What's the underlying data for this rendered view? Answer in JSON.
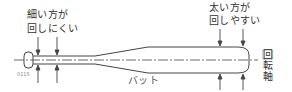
{
  "diagram": {
    "labels": {
      "thin_side_line1": "細い方が",
      "thin_side_line2": "回しにくい",
      "thick_side_line1": "太い方が",
      "thick_side_line2": "回しやすい",
      "bat": "バット",
      "axis_chars": [
        "回",
        "転",
        "軸"
      ],
      "figure_id": "0115"
    },
    "colors": {
      "line": "#444444",
      "text": "#333333",
      "background": "#ffffff"
    }
  }
}
